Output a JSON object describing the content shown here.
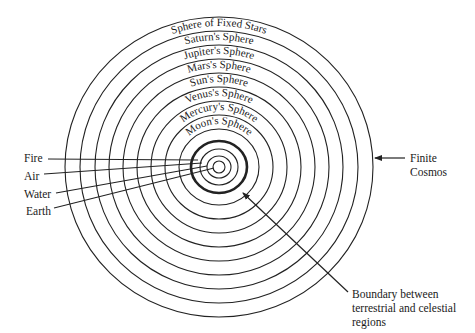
{
  "diagram": {
    "center": {
      "x": 219,
      "y": 167
    },
    "rings": [
      {
        "name": "earth",
        "rx": 6,
        "ry": 6,
        "thick": false
      },
      {
        "name": "water",
        "rx": 12,
        "ry": 11,
        "thick": false
      },
      {
        "name": "air",
        "rx": 19,
        "ry": 18,
        "thick": false
      },
      {
        "name": "fire-boundary",
        "rx": 28,
        "ry": 26,
        "thick": true
      },
      {
        "name": "moon-sphere",
        "rx": 40,
        "ry": 38,
        "thick": false
      },
      {
        "name": "mercury-sphere",
        "rx": 54,
        "ry": 52,
        "thick": false
      },
      {
        "name": "venus-sphere",
        "rx": 68,
        "ry": 66,
        "thick": false
      },
      {
        "name": "sun-sphere",
        "rx": 82,
        "ry": 80,
        "thick": false
      },
      {
        "name": "mars-sphere",
        "rx": 96,
        "ry": 94,
        "thick": false
      },
      {
        "name": "jupiter-sphere",
        "rx": 110,
        "ry": 108,
        "thick": false
      },
      {
        "name": "saturn-sphere",
        "rx": 124,
        "ry": 122,
        "thick": false
      },
      {
        "name": "fixed-stars-sphere",
        "rx": 139,
        "ry": 136,
        "thick": false
      },
      {
        "name": "finite-cosmos",
        "rx": 154,
        "ry": 150,
        "thick": false
      }
    ],
    "sphere_labels": [
      {
        "text": "Sphere of Fixed Stars",
        "r": 141
      },
      {
        "text": "Saturn's Sphere",
        "r": 127
      },
      {
        "text": "Jupiter's Sphere",
        "r": 113
      },
      {
        "text": "Mars's Sphere",
        "r": 99
      },
      {
        "text": "Sun's Sphere",
        "r": 85
      },
      {
        "text": "Venus's Sphere",
        "r": 71
      },
      {
        "text": "Mercury's Sphere",
        "r": 57
      },
      {
        "text": "Moon's Sphere",
        "r": 43
      }
    ],
    "element_labels": {
      "fire": "Fire",
      "air": "Air",
      "water": "Water",
      "earth": "Earth"
    },
    "finite_cosmos_label": [
      "Finite",
      "Cosmos"
    ],
    "boundary_label": [
      "Boundary between",
      "terrestrial and celestial",
      "regions"
    ]
  }
}
